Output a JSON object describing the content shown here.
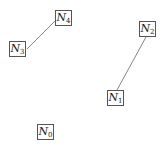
{
  "diagram": {
    "type": "graph",
    "nodes": [
      {
        "id": "N0",
        "label": "N",
        "sub": "0",
        "x": 37,
        "y": 124
      },
      {
        "id": "N1",
        "label": "N",
        "sub": "1",
        "x": 107,
        "y": 90
      },
      {
        "id": "N2",
        "label": "N",
        "sub": "2",
        "x": 139,
        "y": 21
      },
      {
        "id": "N3",
        "label": "N",
        "sub": "3",
        "x": 9,
        "y": 41
      },
      {
        "id": "N4",
        "label": "N",
        "sub": "4",
        "x": 55,
        "y": 10
      }
    ],
    "edges": [
      {
        "from": "N3",
        "to": "N4"
      },
      {
        "from": "N1",
        "to": "N2"
      }
    ],
    "colors": {
      "edge": "#666666",
      "border": "#555555",
      "text": "#222222"
    }
  }
}
